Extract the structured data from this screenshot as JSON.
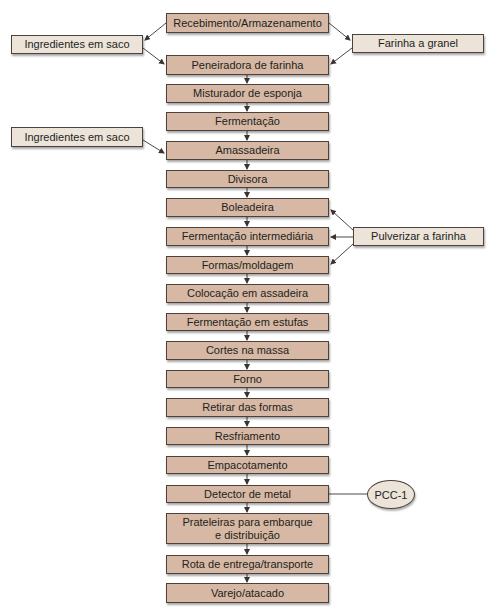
{
  "diagram": {
    "type": "process-flowchart",
    "main_steps": [
      {
        "label": "Recebimento/Armazenamento"
      },
      {
        "label": "Peneiradora de farinha"
      },
      {
        "label": "Misturador de esponja"
      },
      {
        "label": "Fermentação"
      },
      {
        "label": "Amassadeira"
      },
      {
        "label": "Divisora"
      },
      {
        "label": "Boleadeira"
      },
      {
        "label": "Fermentação intermediária"
      },
      {
        "label": "Formas/moldagem"
      },
      {
        "label": "Colocação em assadeira"
      },
      {
        "label": "Fermentação em estufas"
      },
      {
        "label": "Cortes na massa"
      },
      {
        "label": "Forno"
      },
      {
        "label": "Retirar das formas"
      },
      {
        "label": "Resfriamento"
      },
      {
        "label": "Empacotamento"
      },
      {
        "label": "Detector de metal"
      },
      {
        "label": "Prateleiras para embarque e distribuição"
      },
      {
        "label": "Rota de entrega/transporte"
      },
      {
        "label": "Varejo/atacado"
      }
    ],
    "side_inputs": [
      {
        "label": "Ingredientes em saco",
        "from": "Recebimento/Armazenamento",
        "to": "Peneiradora de farinha"
      },
      {
        "label": "Farinha a granel",
        "from": "Recebimento/Armazenamento",
        "to": "Peneiradora de farinha"
      },
      {
        "label": "Ingredientes em saco",
        "to": "Amassadeira"
      },
      {
        "label": "Pulverizar a farinha",
        "to": [
          "Boleadeira",
          "Fermentação intermediária",
          "Formas/moldagem"
        ]
      }
    ],
    "control_point": {
      "label": "PCC-1",
      "attached_to": "Detector de metal"
    },
    "colors": {
      "main_fill": "#d6b8a4",
      "side_fill": "#ece3d9",
      "border": "#4d423b",
      "text": "#231f1c"
    }
  }
}
